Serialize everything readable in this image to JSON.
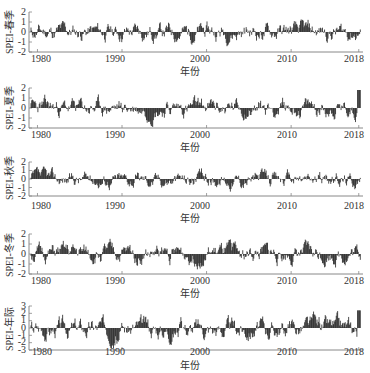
{
  "chart_data": [
    {
      "type": "bar",
      "title": "",
      "ylabel": "SPEI-春季",
      "xlabel": "年份",
      "x_ticks": [
        "1980",
        "1990",
        "2000",
        "2010",
        "2018"
      ],
      "y_ticks": [
        "2",
        "1",
        "0",
        "-1",
        "-2"
      ],
      "ylim": [
        -2,
        2
      ],
      "xlim": [
        1979,
        2018.5
      ],
      "grid": false,
      "series_description": "Monthly SPEI spring series, fluctuating mostly between -1.5 and 1.5",
      "seed": 11
    },
    {
      "type": "bar",
      "title": "",
      "ylabel": "SPEI-夏季",
      "xlabel": "年份",
      "x_ticks": [
        "1980",
        "1990",
        "2000",
        "2010",
        "2018"
      ],
      "y_ticks": [
        "2",
        "1",
        "0",
        "-1",
        "-2"
      ],
      "ylim": [
        -2,
        2
      ],
      "xlim": [
        1979,
        2018.5
      ],
      "grid": false,
      "series_description": "Monthly SPEI summer series, peak near 2 at end of 2018",
      "seed": 23
    },
    {
      "type": "bar",
      "title": "",
      "ylabel": "SPEI-秋季",
      "xlabel": "年份",
      "x_ticks": [
        "1980",
        "1990",
        "2000",
        "2010",
        "2018"
      ],
      "y_ticks": [
        "2",
        "1",
        "0",
        "-1",
        "-2"
      ],
      "ylim": [
        -2,
        2
      ],
      "xlim": [
        1979,
        2018.5
      ],
      "grid": false,
      "series_description": "Monthly SPEI autumn series, mostly within -1.5 to 1.5",
      "seed": 37
    },
    {
      "type": "bar",
      "title": "",
      "ylabel": "SPEI-冬季",
      "xlabel": "年份",
      "x_ticks": [
        "1980",
        "1990",
        "2000",
        "2010",
        "2018"
      ],
      "y_ticks": [
        "2",
        "1",
        "0",
        "-1",
        "-2"
      ],
      "ylim": [
        -2,
        2
      ],
      "xlim": [
        1979,
        2018.5
      ],
      "grid": false,
      "series_description": "Monthly SPEI winter series, positive cluster ~1993, negatives ~2008-2009",
      "seed": 51
    },
    {
      "type": "bar",
      "title": "",
      "ylabel": "SPEI-年际",
      "xlabel": "年份",
      "x_ticks": [
        "1980",
        "1990",
        "2000",
        "2010",
        "2018"
      ],
      "y_ticks": [
        "3",
        "2",
        "1",
        "0",
        "-1",
        "-2",
        "-3"
      ],
      "ylim": [
        -3,
        3
      ],
      "xlim": [
        1979,
        2018.5
      ],
      "grid": false,
      "series_description": "Monthly SPEI annual series, range about -2.5 to 2.5, peak near 2.5 at 2018",
      "seed": 67
    }
  ],
  "panels": [
    {
      "ylabel": "SPEI-春季",
      "xlabel": "年份",
      "yticks": [
        "2",
        "1",
        "0",
        "-1",
        "-2"
      ],
      "xticks": [
        "1980",
        "1990",
        "2000",
        "2010",
        "2018"
      ]
    },
    {
      "ylabel": "SPEI-夏季",
      "xlabel": "年份",
      "yticks": [
        "2",
        "1",
        "0",
        "-1",
        "-2"
      ],
      "xticks": [
        "1980",
        "1990",
        "2000",
        "2010",
        "2018"
      ]
    },
    {
      "ylabel": "SPEI-秋季",
      "xlabel": "年份",
      "yticks": [
        "2",
        "1",
        "0",
        "-1",
        "-2"
      ],
      "xticks": [
        "1980",
        "1990",
        "2000",
        "2010",
        "2018"
      ]
    },
    {
      "ylabel": "SPEI-冬季",
      "xlabel": "年份",
      "yticks": [
        "2",
        "1",
        "0",
        "-1",
        "-2"
      ],
      "xticks": [
        "1980",
        "1990",
        "2000",
        "2010",
        "2018"
      ]
    },
    {
      "ylabel": "SPEI-年际",
      "xlabel": "年份",
      "yticks": [
        "3",
        "2",
        "1",
        "0",
        "-1",
        "-2",
        "-3"
      ],
      "xticks": [
        "1980",
        "1990",
        "2000",
        "2010",
        "2018"
      ]
    }
  ],
  "colors": {
    "bars": "#111111",
    "axis": "#888888"
  }
}
